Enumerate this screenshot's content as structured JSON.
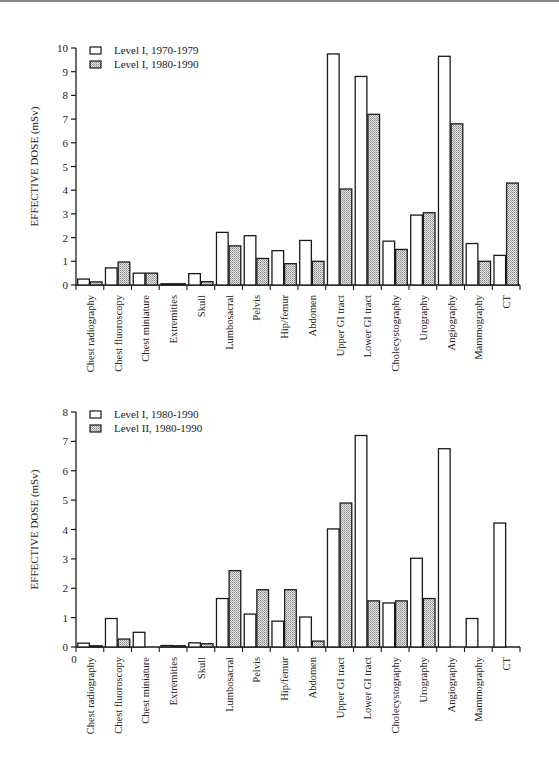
{
  "chart_data": [
    {
      "type": "bar",
      "title": "",
      "xlabel": "",
      "ylabel": "EFFECTIVE DOSE (mSv)",
      "ylim": [
        0,
        10
      ],
      "yticks": [
        0,
        1,
        2,
        3,
        4,
        5,
        6,
        7,
        8,
        9,
        10
      ],
      "grid": false,
      "legend_position": "top-left",
      "categories": [
        "Chest radiography",
        "Chest fluoroscopy",
        "Chest miniature",
        "Extremities",
        "Skull",
        "Lumbosacral",
        "Pelvis",
        "Hip/femur",
        "Abdomen",
        "Upper GI tract",
        "Lower GI tract",
        "Cholecystography",
        "Urography",
        "Angiography",
        "Mammography",
        "CT"
      ],
      "series": [
        {
          "name": "Level I, 1970-1979",
          "style": "white",
          "values": [
            0.25,
            0.72,
            0.5,
            0.02,
            0.48,
            2.22,
            2.08,
            1.45,
            1.88,
            9.75,
            8.8,
            1.85,
            2.95,
            9.65,
            1.75,
            1.25
          ]
        },
        {
          "name": "Level I, 1980-1990",
          "style": "hatched",
          "values": [
            0.13,
            0.97,
            0.5,
            0.05,
            0.14,
            1.65,
            1.12,
            0.9,
            1.0,
            4.05,
            7.2,
            1.5,
            3.05,
            6.8,
            1.0,
            4.3
          ]
        }
      ]
    },
    {
      "type": "bar",
      "title": "",
      "xlabel": "",
      "ylabel": "EFFECTIVE DOSE (mSv)",
      "ylim": [
        0,
        8
      ],
      "yticks": [
        0,
        1,
        2,
        3,
        4,
        5,
        6,
        7,
        8
      ],
      "grid": false,
      "legend_position": "top-left",
      "categories": [
        "Chest radiography",
        "Chest fluoroscopy",
        "Chest miniature",
        "Extremities",
        "Skull",
        "Lumbosacral",
        "Pelvis",
        "Hip/femur",
        "Abdomen",
        "Upper GI tract",
        "Lower GI tract",
        "Cholecystography",
        "Urography",
        "Angiography",
        "Mammography",
        "CT"
      ],
      "series": [
        {
          "name": "Level I, 1980-1990",
          "style": "white",
          "values": [
            0.13,
            0.97,
            0.5,
            0.05,
            0.14,
            1.65,
            1.12,
            0.88,
            1.02,
            4.02,
            7.2,
            1.5,
            3.02,
            6.75,
            0.97,
            4.22
          ]
        },
        {
          "name": "Level II, 1980-1990",
          "style": "hatched",
          "values": [
            0.04,
            0.27,
            0,
            0.02,
            0.11,
            2.6,
            1.95,
            1.95,
            0.2,
            4.9,
            1.57,
            1.57,
            1.65,
            0,
            0,
            0
          ]
        }
      ]
    }
  ],
  "charts": [
    {
      "ylabel": "EFFECTIVE DOSE (mSv)",
      "legend": [
        "Level I, 1970-1979",
        "Level I, 1980-1990"
      ]
    },
    {
      "ylabel": "EFFECTIVE DOSE (mSv)",
      "legend": [
        "Level I, 1980-1990",
        "Level II, 1980-1990"
      ],
      "origin_label": "0"
    }
  ],
  "colors": {
    "bar_white": "#ffffff",
    "bar_hatched": "#c8c8c8",
    "stroke": "#1a1a1a"
  }
}
